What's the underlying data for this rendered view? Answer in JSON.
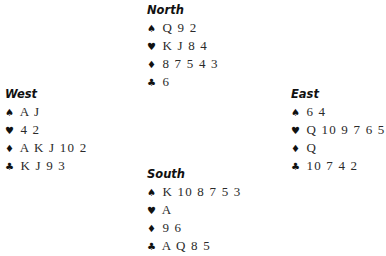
{
  "hands": {
    "north": {
      "title": "North",
      "spades": "Q 9 2",
      "hearts": "K J 8 4",
      "diamonds": "8 7 5 4 3",
      "clubs": "6"
    },
    "west": {
      "title": "West",
      "spades": "A J",
      "hearts": "4 2",
      "diamonds": "A K J 10 2",
      "clubs": "K J 9 3"
    },
    "east": {
      "title": "East",
      "spades": "6 4",
      "hearts": "Q 10 9 7 6 5",
      "diamonds": "Q",
      "clubs": "10 7 4 2"
    },
    "south": {
      "title": "South",
      "spades": "K 10 8 7 5 3",
      "hearts": "A",
      "diamonds": "9 6",
      "clubs": "A Q 8 5"
    }
  },
  "suit_symbols": {
    "spades": "♠",
    "hearts": "♥",
    "diamonds": "♦",
    "clubs": "♣"
  }
}
